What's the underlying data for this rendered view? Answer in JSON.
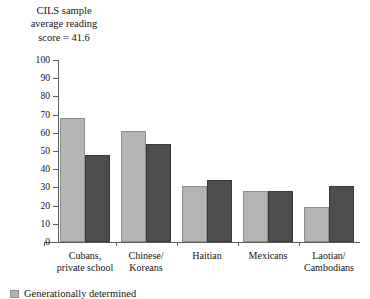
{
  "title": {
    "line1": "CILS sample",
    "line2": "average reading",
    "line3": "score = 41.6"
  },
  "legend": {
    "swatch_color": "#b4b4b4",
    "label": "Generationally determined"
  },
  "colors": {
    "light_bar": "#b4b4b4",
    "light_bar_border": "#8e8e8e",
    "dark_bar": "#4d4d4d",
    "dark_bar_border": "#3a3a3a",
    "axis": "#5c5c5c",
    "text": "#141414",
    "background": "#ffffff"
  },
  "axis": {
    "y_ticks": [
      "100",
      "90",
      "80",
      "70",
      "60",
      "50",
      "40",
      "30",
      "20",
      "10",
      "0"
    ],
    "y_min": 0,
    "y_max": 100,
    "y_step": 10
  },
  "categories": [
    {
      "line1": "Cubans,",
      "line2": "private school"
    },
    {
      "line1": "Chinese/",
      "line2": "Koreans"
    },
    {
      "line1": "Haitian",
      "line2": ""
    },
    {
      "line1": "Mexicans",
      "line2": ""
    },
    {
      "line1": "Laotian/",
      "line2": "Cambodians"
    }
  ],
  "chart_data": {
    "type": "bar",
    "title": "CILS sample average reading score = 41.6",
    "xlabel": "",
    "ylabel": "",
    "ylim": [
      0,
      100
    ],
    "ytick_step": 10,
    "grid": false,
    "legend_position": "bottom-left",
    "categories": [
      "Cubans, private school",
      "Chinese/Koreans",
      "Haitian",
      "Mexicans",
      "Laotian/Cambodians"
    ],
    "series": [
      {
        "name": "Light gray series",
        "color": "#b4b4b4",
        "values": [
          68,
          61,
          31,
          28,
          19
        ]
      },
      {
        "name": "Dark gray series",
        "color": "#4d4d4d",
        "values": [
          48,
          54,
          34,
          28,
          31
        ]
      }
    ],
    "annotations": [
      "CILS sample average reading score = 41.6"
    ]
  }
}
